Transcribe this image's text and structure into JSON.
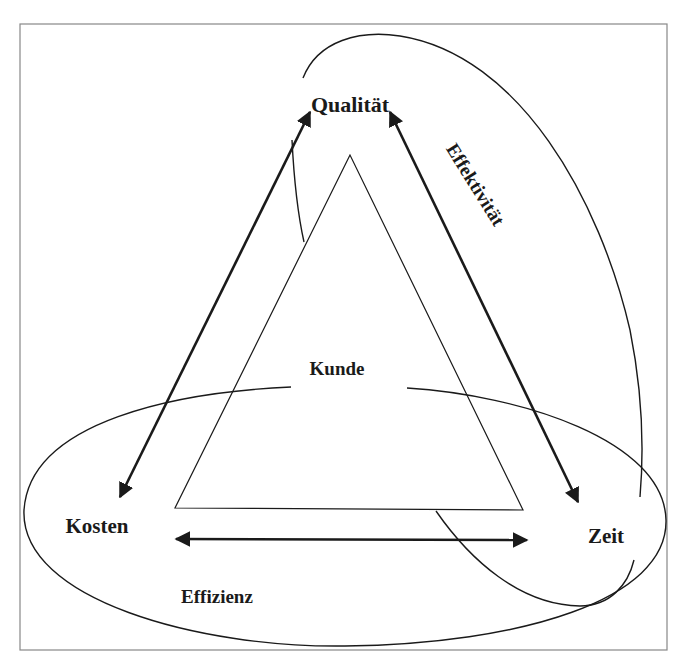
{
  "diagram": {
    "type": "triangle-concept-diagram",
    "nodes": {
      "top": "Qualität",
      "left": "Kosten",
      "right": "Zeit",
      "center": "Kunde"
    },
    "regions": {
      "bottom_ellipse": "Effizienz",
      "right_ellipse": "Effektivität"
    },
    "arrows": [
      {
        "from": "Qualität",
        "to": "Kosten",
        "bidirectional": true
      },
      {
        "from": "Qualität",
        "to": "Zeit",
        "bidirectional": true
      },
      {
        "from": "Kosten",
        "to": "Zeit",
        "bidirectional": true
      }
    ],
    "colors": {
      "stroke": "#1a1a1a",
      "frame": "#888888",
      "background": "#ffffff"
    }
  }
}
